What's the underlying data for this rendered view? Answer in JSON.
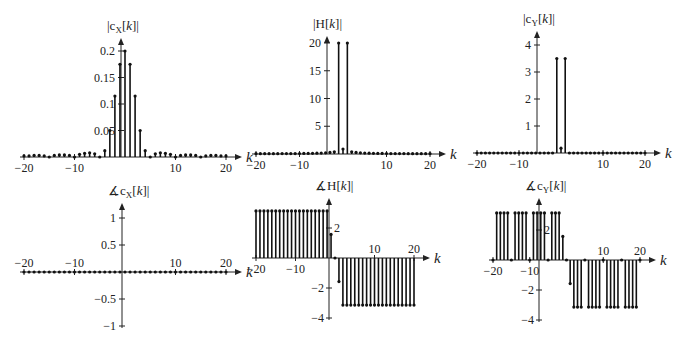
{
  "chart_data": [
    {
      "id": "cx_mag",
      "type": "stem",
      "title": "|c_X[k]|",
      "xlabel": "k",
      "ylabel": "",
      "x_ticks": [
        -20,
        -10,
        10,
        20
      ],
      "y_ticks": [
        0.05,
        0.1,
        0.15,
        0.2
      ],
      "xlim": [
        -20,
        20
      ],
      "ylim": [
        0,
        0.22
      ],
      "x": [
        -20,
        -19,
        -18,
        -17,
        -16,
        -15,
        -14,
        -13,
        -12,
        -11,
        -10,
        -9,
        -8,
        -7,
        -6,
        -5,
        -4,
        -3,
        -2,
        -1,
        0,
        1,
        2,
        3,
        4,
        5,
        6,
        7,
        8,
        9,
        10,
        11,
        12,
        13,
        14,
        15,
        16,
        17,
        18,
        19,
        20
      ],
      "values": [
        0.002,
        0.002,
        0.003,
        0.003,
        0.002,
        0,
        0.003,
        0.004,
        0.004,
        0.003,
        0,
        0.005,
        0.007,
        0.008,
        0.006,
        0,
        0.012,
        0.05,
        0.115,
        0.175,
        0.2,
        0.175,
        0.115,
        0.05,
        0.012,
        0,
        0.006,
        0.008,
        0.007,
        0.005,
        0,
        0.003,
        0.004,
        0.004,
        0.003,
        0,
        0.002,
        0.003,
        0.003,
        0.002,
        0.002
      ]
    },
    {
      "id": "h_mag",
      "type": "stem",
      "title": "|H[k]|",
      "xlabel": "k",
      "x_ticks": [
        -20,
        -10,
        10,
        20
      ],
      "y_ticks": [
        5,
        10,
        15,
        20
      ],
      "xlim": [
        -20,
        20
      ],
      "ylim": [
        0,
        22
      ],
      "x": [
        -20,
        -19,
        -18,
        -17,
        -16,
        -15,
        -14,
        -13,
        -12,
        -11,
        -10,
        -9,
        -8,
        -7,
        -6,
        -5,
        -4,
        -3,
        -2,
        -1,
        0,
        1,
        2,
        3,
        4,
        5,
        6,
        7,
        8,
        9,
        10,
        11,
        12,
        13,
        14,
        15,
        16,
        17,
        18,
        19,
        20
      ],
      "values": [
        0.05,
        0.05,
        0.05,
        0.06,
        0.06,
        0.06,
        0.07,
        0.07,
        0.08,
        0.08,
        0.09,
        0.1,
        0.11,
        0.12,
        0.14,
        0.17,
        0.21,
        0.28,
        0.4,
        20,
        0.9,
        20,
        0.4,
        0.28,
        0.21,
        0.17,
        0.14,
        0.12,
        0.11,
        0.1,
        0.09,
        0.08,
        0.08,
        0.07,
        0.07,
        0.06,
        0.06,
        0.06,
        0.05,
        0.05,
        0.05
      ]
    },
    {
      "id": "cy_mag",
      "type": "stem",
      "title": "|c_Y[k]|",
      "xlabel": "k",
      "x_ticks": [
        -20,
        -10,
        10,
        20
      ],
      "y_ticks": [
        1,
        2,
        3,
        4
      ],
      "xlim": [
        -20,
        20
      ],
      "ylim": [
        0,
        4.4
      ],
      "x": [
        -20,
        -19,
        -18,
        -17,
        -16,
        -15,
        -14,
        -13,
        -12,
        -11,
        -10,
        -9,
        -8,
        -7,
        -6,
        -5,
        -4,
        -3,
        -2,
        -1,
        0,
        1,
        2,
        3,
        4,
        5,
        6,
        7,
        8,
        9,
        10,
        11,
        12,
        13,
        14,
        15,
        16,
        17,
        18,
        19,
        20
      ],
      "values": [
        0,
        0,
        0,
        0,
        0,
        0,
        0,
        0,
        0,
        0,
        0,
        0,
        0,
        0,
        0,
        0,
        0,
        0,
        0,
        3.5,
        0.18,
        3.5,
        0,
        0,
        0,
        0,
        0,
        0,
        0,
        0,
        0,
        0,
        0,
        0,
        0,
        0,
        0,
        0,
        0,
        0,
        0
      ]
    },
    {
      "id": "cx_phase",
      "type": "stem",
      "title": "∡c_X[k]",
      "xlabel": "k",
      "x_ticks": [
        -20,
        -10,
        10,
        20
      ],
      "y_ticks": [
        -1,
        -0.5,
        0.5,
        1
      ],
      "xlim": [
        -20,
        20
      ],
      "ylim": [
        -1,
        1.2
      ],
      "x": [
        -20,
        -19,
        -18,
        -17,
        -16,
        -15,
        -14,
        -13,
        -12,
        -11,
        -10,
        -9,
        -8,
        -7,
        -6,
        -5,
        -4,
        -3,
        -2,
        -1,
        0,
        1,
        2,
        3,
        4,
        5,
        6,
        7,
        8,
        9,
        10,
        11,
        12,
        13,
        14,
        15,
        16,
        17,
        18,
        19,
        20
      ],
      "values": [
        0,
        0,
        0,
        0,
        0,
        0,
        0,
        0,
        0,
        0,
        0,
        0,
        0,
        0,
        0,
        0,
        0,
        0,
        0,
        0,
        0,
        0,
        0,
        0,
        0,
        0,
        0,
        0,
        0,
        0,
        0,
        0,
        0,
        0,
        0,
        0,
        0,
        0,
        0,
        0,
        0
      ]
    },
    {
      "id": "h_phase",
      "type": "stem",
      "title": "∡H[k]",
      "xlabel": "k",
      "x_ticks": [
        -20,
        -10,
        10,
        20
      ],
      "y_ticks": [
        -4,
        -2,
        2
      ],
      "xlim": [
        -20,
        20
      ],
      "ylim": [
        -4,
        3.5
      ],
      "x": [
        -20,
        -19,
        -18,
        -17,
        -16,
        -15,
        -14,
        -13,
        -12,
        -11,
        -10,
        -9,
        -8,
        -7,
        -6,
        -5,
        -4,
        -3,
        -2,
        -1,
        0,
        1,
        2,
        3,
        4,
        5,
        6,
        7,
        8,
        9,
        10,
        11,
        12,
        13,
        14,
        15,
        16,
        17,
        18,
        19,
        20
      ],
      "values": [
        3.14,
        3.14,
        3.14,
        3.14,
        3.14,
        3.14,
        3.14,
        3.14,
        3.14,
        3.14,
        3.14,
        3.14,
        3.14,
        3.14,
        3.14,
        3.14,
        3.14,
        3.14,
        3.14,
        1.57,
        0,
        -1.57,
        -3.14,
        -3.14,
        -3.14,
        -3.14,
        -3.14,
        -3.14,
        -3.14,
        -3.14,
        -3.14,
        -3.14,
        -3.14,
        -3.14,
        -3.14,
        -3.14,
        -3.14,
        -3.14,
        -3.14,
        -3.14,
        -3.14
      ]
    },
    {
      "id": "cy_phase",
      "type": "stem",
      "title": "∡c_Y[k]",
      "xlabel": "k",
      "x_ticks": [
        -20,
        -10,
        10,
        20
      ],
      "y_ticks": [
        -4,
        -2,
        2
      ],
      "xlim": [
        -20,
        20
      ],
      "ylim": [
        -4,
        3.5
      ],
      "x": [
        -20,
        -19,
        -18,
        -17,
        -16,
        -15,
        -14,
        -13,
        -12,
        -11,
        -10,
        -9,
        -8,
        -7,
        -6,
        -5,
        -4,
        -3,
        -2,
        -1,
        0,
        1,
        2,
        3,
        4,
        5,
        6,
        7,
        8,
        9,
        10,
        11,
        12,
        13,
        14,
        15,
        16,
        17,
        18,
        19,
        20
      ],
      "values": [
        0,
        3.14,
        3.14,
        3.14,
        3.14,
        0,
        3.14,
        3.14,
        3.14,
        3.14,
        0,
        3.14,
        3.14,
        3.14,
        3.14,
        0,
        3.14,
        3.14,
        3.14,
        1.57,
        0,
        -1.57,
        -3.14,
        -3.14,
        -3.14,
        0,
        -3.14,
        -3.14,
        -3.14,
        -3.14,
        0,
        -3.14,
        -3.14,
        -3.14,
        -3.14,
        0,
        -3.14,
        -3.14,
        -3.14,
        -3.14,
        0
      ]
    }
  ],
  "panels": [
    {
      "title_main": "|c",
      "title_sub": "X",
      "title_mid": "[",
      "title_k": "k",
      "title_end": "]|"
    },
    {
      "title_main": "|H[",
      "title_sub": "",
      "title_mid": "",
      "title_k": "k",
      "title_end": "]|"
    },
    {
      "title_main": "|c",
      "title_sub": "Y",
      "title_mid": "[",
      "title_k": "k",
      "title_end": "]|"
    },
    {
      "title_main": "∡c",
      "title_sub": "X",
      "title_mid": "[",
      "title_k": "k",
      "title_end": "]|"
    },
    {
      "title_main": "∡H[",
      "title_sub": "",
      "title_mid": "",
      "title_k": "k",
      "title_end": "]|"
    },
    {
      "title_main": "∡c",
      "title_sub": "Y",
      "title_mid": "[",
      "title_k": "k",
      "title_end": "]|"
    }
  ],
  "axis_label": "k"
}
